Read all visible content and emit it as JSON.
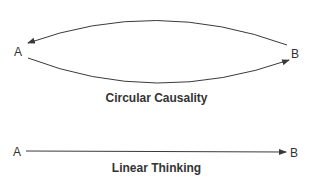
{
  "circular": {
    "node_a": "A",
    "node_b": "B",
    "caption": "Circular Causality"
  },
  "linear": {
    "node_a": "A",
    "node_b": "B",
    "caption": "Linear Thinking"
  },
  "colors": {
    "stroke": "#3a3a3a",
    "text": "#333333",
    "background": "#ffffff"
  }
}
